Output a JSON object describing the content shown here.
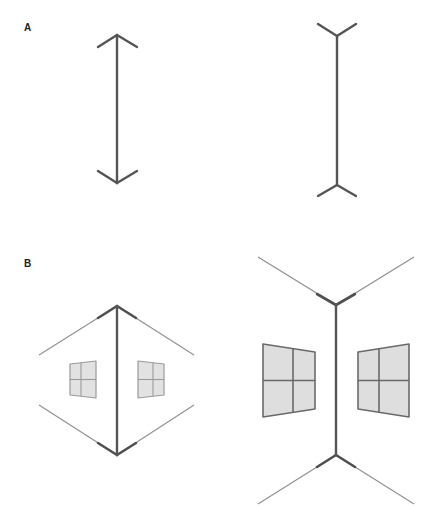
{
  "figure": {
    "type": "Müller-Lyer illusion",
    "panels": [
      {
        "label": "A",
        "description": "Classic Müller-Lyer figures",
        "figures": [
          {
            "id": "arrow-inward",
            "fin_direction": "inward",
            "description": "Shaft with arrowheads pointing outward (fins closed)"
          },
          {
            "id": "arrow-outward",
            "fin_direction": "outward",
            "description": "Shaft with fins opened (tail-fins)"
          }
        ]
      },
      {
        "label": "B",
        "description": "Architectural corner interpretation",
        "figures": [
          {
            "id": "outside-corner",
            "description": "Convex building corner with windows, receding edges"
          },
          {
            "id": "inside-corner",
            "description": "Concave room corner with windows, edges extending outward"
          }
        ]
      }
    ]
  },
  "labels": {
    "panel_a": "A",
    "panel_b": "B"
  },
  "colors": {
    "line": "#555555",
    "thin_line": "#8f8f8f",
    "window_fill": "#dedede",
    "background": "#ffffff"
  }
}
